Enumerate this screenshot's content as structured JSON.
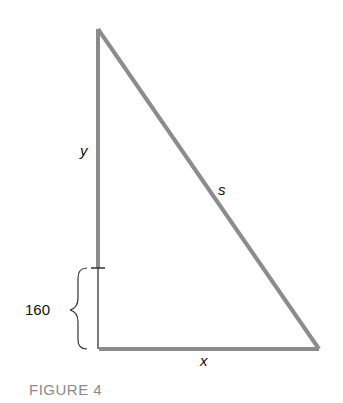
{
  "figure": {
    "caption": "FIGURE 4",
    "labels": {
      "vertical_side": "y",
      "hypotenuse": "s",
      "horizontal_side": "x",
      "offset_value": "160"
    },
    "colors": {
      "triangle_stroke": "#8c8c8c",
      "thin_line": "#333333",
      "caption": "#8a8a8a"
    }
  }
}
